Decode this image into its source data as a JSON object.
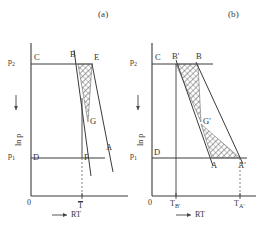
{
  "figure": {
    "panels": [
      {
        "id": "a",
        "label": "(a)",
        "y_axis_label": "ln p",
        "x_axis_label": "RT",
        "origin_label": "0",
        "y_ticks": [
          {
            "label": "p",
            "sub": "2"
          },
          {
            "label": "p",
            "sub": "1"
          }
        ],
        "x_ticks": [
          {
            "label": "T",
            "sub": "",
            "overline": true
          }
        ],
        "points": [
          {
            "name": "C"
          },
          {
            "name": "B"
          },
          {
            "name": "E"
          },
          {
            "name": "G"
          },
          {
            "name": "A"
          },
          {
            "name": "D"
          },
          {
            "name": "F"
          }
        ]
      },
      {
        "id": "b",
        "label": "(b)",
        "y_axis_label": "ln p",
        "x_axis_label": "RT",
        "origin_label": "0",
        "y_ticks": [
          {
            "label": "p",
            "sub": "2"
          },
          {
            "label": "p",
            "sub": "1"
          }
        ],
        "x_ticks": [
          {
            "label": "T",
            "sub": "B'"
          },
          {
            "label": "T",
            "sub": "A'"
          }
        ],
        "points": [
          {
            "name": "C"
          },
          {
            "name": "B'"
          },
          {
            "name": "B"
          },
          {
            "name": "G'"
          },
          {
            "name": "D"
          },
          {
            "name": "A"
          },
          {
            "name": "A'"
          }
        ]
      }
    ],
    "colors": {
      "line": "#3a3a3a",
      "hatch": "#555555",
      "dashed": "#777777",
      "text": "#333333",
      "background": "#ffffff"
    }
  }
}
